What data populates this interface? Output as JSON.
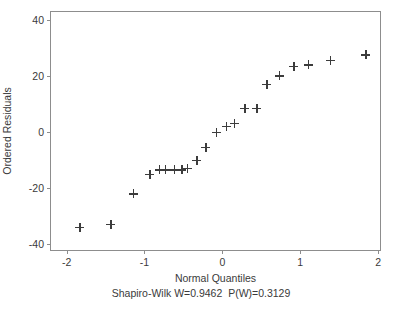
{
  "chart_data": {
    "type": "scatter",
    "title": "",
    "xlabel": "Normal Quantiles",
    "ylabel": "Ordered Residuals",
    "xlim": [
      -2.2,
      2.05
    ],
    "ylim": [
      -42.8,
      42.8
    ],
    "xticks": [
      -2,
      -1,
      0,
      1,
      2
    ],
    "xticklabels": [
      "-2",
      "-1",
      "0",
      "1",
      "2"
    ],
    "yticks": [
      40,
      20,
      0,
      -20,
      -40
    ],
    "yticklabels": [
      "40",
      "20",
      "0",
      "-20",
      "-40"
    ],
    "grid": false,
    "legend": null,
    "marker": "plus",
    "marker_color": "#3c3c3c",
    "frame_color": "#8d8d8d",
    "annotation": "Shapiro-Wilk W=0.9462  P(W)=0.3129",
    "statistics": {
      "test": "Shapiro-Wilk",
      "W": 0.9462,
      "P_W": 0.3129
    },
    "n_points": 25,
    "points": [
      {
        "x": -1.83,
        "y": -34.0
      },
      {
        "x": -1.43,
        "y": -33.0
      },
      {
        "x": -1.14,
        "y": -22.0
      },
      {
        "x": -0.93,
        "y": -15.0
      },
      {
        "x": -0.81,
        "y": -13.5
      },
      {
        "x": -0.73,
        "y": -13.5
      },
      {
        "x": -0.62,
        "y": -13.5
      },
      {
        "x": -0.52,
        "y": -13.5
      },
      {
        "x": -0.45,
        "y": -13.0
      },
      {
        "x": -0.33,
        "y": -10.0
      },
      {
        "x": -0.21,
        "y": -5.5
      },
      {
        "x": -0.08,
        "y": 0.0
      },
      {
        "x": 0.05,
        "y": 2.0
      },
      {
        "x": 0.15,
        "y": 3.0
      },
      {
        "x": 0.29,
        "y": 8.5
      },
      {
        "x": 0.44,
        "y": 8.5
      },
      {
        "x": 0.57,
        "y": 17.0
      },
      {
        "x": 0.73,
        "y": 20.0
      },
      {
        "x": 0.92,
        "y": 23.5
      },
      {
        "x": 1.1,
        "y": 24.0
      },
      {
        "x": 1.39,
        "y": 25.5
      },
      {
        "x": 1.84,
        "y": 27.5
      }
    ]
  }
}
